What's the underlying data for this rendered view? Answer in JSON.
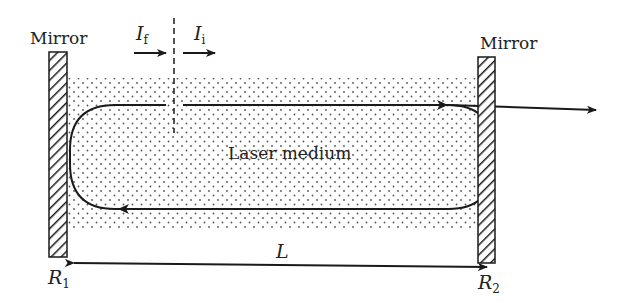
{
  "diagram": {
    "labels": {
      "mirror_left": "Mirror",
      "mirror_right": "Mirror",
      "intensity_f": "I",
      "intensity_f_sub": "f",
      "intensity_i": "I",
      "intensity_i_sub": "i",
      "medium": "Laser medium",
      "length": "L",
      "reflectivity_left": "R",
      "reflectivity_left_sub": "1",
      "reflectivity_right": "R",
      "reflectivity_right_sub": "2"
    },
    "elements": [
      "left mirror (hatched)",
      "right mirror (hatched, partially transmitting)",
      "stippled laser medium",
      "closed beam loop with arrows",
      "output beam arrow",
      "dashed reference plane",
      "length dimension arrow"
    ],
    "colors": {
      "ink": "#1a1a1a",
      "stipple": "#555555",
      "background": "#ffffff"
    }
  }
}
